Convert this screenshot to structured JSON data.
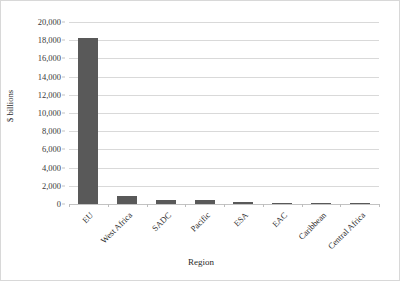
{
  "chart_data": {
    "type": "bar",
    "title": "",
    "xlabel": "Region",
    "ylabel": "$ billions",
    "categories": [
      "EU",
      "West Africa",
      "SADC",
      "Pacific",
      "ESA",
      "EAC",
      "Caribbean",
      "Central Africa"
    ],
    "values": [
      18200,
      850,
      480,
      400,
      170,
      150,
      110,
      90
    ],
    "ylim": [
      0,
      20000
    ],
    "ytick_labels": [
      "0",
      "2,000",
      "4,000",
      "6,000",
      "8,000",
      "10,000",
      "12,000",
      "14,000",
      "16,000",
      "18,000",
      "20,000"
    ],
    "ytick_values": [
      0,
      2000,
      4000,
      6000,
      8000,
      10000,
      12000,
      14000,
      16000,
      18000,
      20000
    ],
    "grid": true,
    "legend": false,
    "legend_position": "none",
    "bar_color": "#595959",
    "gridline_color": "#d9d9d9",
    "axis_text_color": "#2b2b2b"
  }
}
